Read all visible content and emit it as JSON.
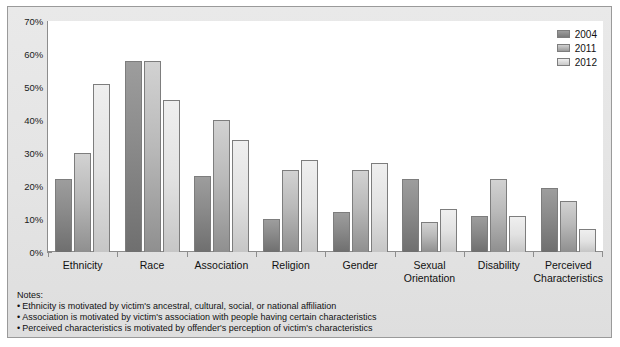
{
  "chart_data": {
    "type": "bar",
    "title": "",
    "xlabel": "",
    "ylabel": "",
    "ylim": [
      0,
      70
    ],
    "ytick_labels": [
      "70%",
      "60%",
      "50%",
      "40%",
      "30%",
      "20%",
      "10%",
      "0%"
    ],
    "ytick_values": [
      70,
      60,
      50,
      40,
      30,
      20,
      10,
      0
    ],
    "grid": false,
    "legend_position": "top-right",
    "categories": [
      "Ethnicity",
      "Race",
      "Association",
      "Religion",
      "Gender",
      "Sexual Orientation",
      "Disability",
      "Perceived Characteristics"
    ],
    "series": [
      {
        "name": "2004",
        "color": "#8c8c8c",
        "values": [
          22,
          58,
          23,
          10,
          12,
          22,
          11,
          19.5
        ]
      },
      {
        "name": "2011",
        "color": "#b9b9b9",
        "values": [
          30,
          58,
          40,
          25,
          25,
          9,
          22,
          15.5
        ]
      },
      {
        "name": "2012",
        "color": "#e2e2e2",
        "values": [
          51,
          46,
          34,
          28,
          27,
          13,
          11,
          7
        ]
      }
    ]
  },
  "legend": {
    "items": [
      {
        "label": "2004"
      },
      {
        "label": "2011"
      },
      {
        "label": "2012"
      }
    ]
  },
  "x_labels": [
    {
      "line1": "Ethnicity",
      "line2": ""
    },
    {
      "line1": "Race",
      "line2": ""
    },
    {
      "line1": "Association",
      "line2": ""
    },
    {
      "line1": "Religion",
      "line2": ""
    },
    {
      "line1": "Gender",
      "line2": ""
    },
    {
      "line1": "Sexual",
      "line2": "Orientation"
    },
    {
      "line1": "Disability",
      "line2": ""
    },
    {
      "line1": "Perceived",
      "line2": "Characteristics"
    }
  ],
  "notes": {
    "title": "Notes:",
    "lines": [
      "Ethnicity is motivated by victim's ancestral, cultural, social, or national affiliation",
      "Association is motivated by victim's association with people having certain characteristics",
      "Perceived characteristics is motivated by offender's perception of victim's characteristics"
    ]
  }
}
